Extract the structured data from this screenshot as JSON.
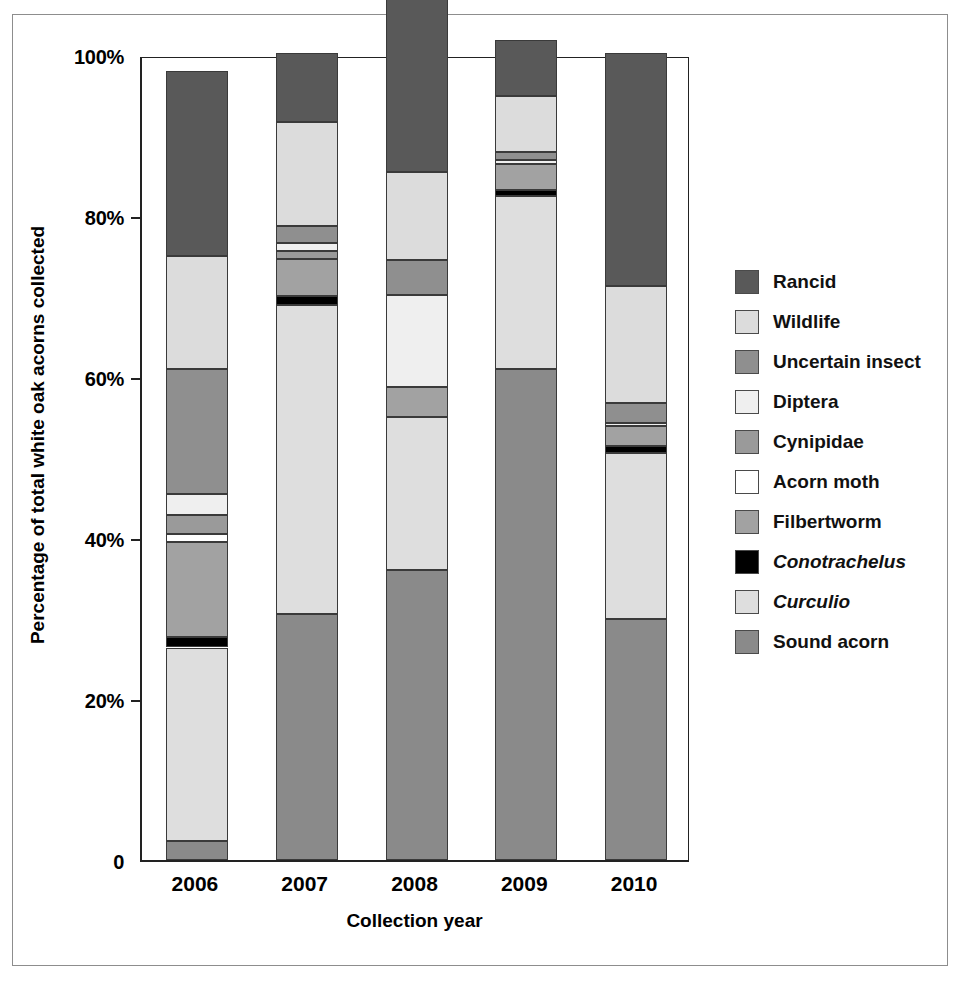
{
  "chart_data": {
    "type": "bar",
    "subtype": "stacked-percentage",
    "title": "",
    "xlabel": "Collection year",
    "ylabel": "Percentage of total white oak acorns collected",
    "categories": [
      "2006",
      "2007",
      "2008",
      "2009",
      "2010"
    ],
    "ylim": [
      0,
      100
    ],
    "ytick_labels": [
      "0",
      "20%",
      "40%",
      "60%",
      "80%",
      "100%"
    ],
    "ytick_values": [
      0,
      20,
      40,
      60,
      80,
      100
    ],
    "grid": false,
    "legend_position": "right",
    "stack_order_bottom_to_top": [
      "Sound acorn",
      "Curculio",
      "Conotrachelus",
      "Filbertworm",
      "Acorn moth",
      "Cynipidae",
      "Diptera",
      "Uncertain insect",
      "Wildlife",
      "Rancid"
    ],
    "series": [
      {
        "name": "Sound acorn",
        "italic": false,
        "color": "#8a8a8a",
        "values": [
          2.4,
          30.5,
          36.0,
          61.0,
          30.0
        ]
      },
      {
        "name": "Curculio",
        "italic": true,
        "color": "#dedede",
        "values": [
          24.0,
          38.5,
          19.0,
          21.5,
          20.5
        ]
      },
      {
        "name": "Conotrachelus",
        "italic": true,
        "color": "#000000",
        "values": [
          1.3,
          1.1,
          0.0,
          0.7,
          0.9
        ]
      },
      {
        "name": "Filbertworm",
        "italic": false,
        "color": "#a2a2a2",
        "values": [
          11.8,
          4.6,
          3.7,
          3.3,
          2.5
        ]
      },
      {
        "name": "Acorn moth",
        "italic": false,
        "color": "#ffffff",
        "values": [
          1.0,
          0.0,
          0.0,
          0.0,
          0.0
        ]
      },
      {
        "name": "Cynipidae",
        "italic": false,
        "color": "#9a9a9a",
        "values": [
          2.3,
          1.0,
          0.0,
          0.0,
          0.0
        ]
      },
      {
        "name": "Diptera",
        "italic": false,
        "color": "#efefef",
        "values": [
          2.7,
          1.0,
          11.5,
          0.4,
          0.4
        ]
      },
      {
        "name": "Uncertain insect",
        "italic": false,
        "color": "#8f8f8f",
        "values": [
          15.5,
          2.0,
          4.3,
          1.0,
          2.5
        ]
      },
      {
        "name": "Wildlife",
        "italic": false,
        "color": "#dcdcdc",
        "values": [
          14.0,
          13.0,
          11.0,
          7.0,
          14.5
        ]
      },
      {
        "name": "Rancid",
        "italic": false,
        "color": "#595959",
        "values": [
          23.0,
          8.5,
          25.0,
          7.0,
          29.0
        ]
      }
    ]
  },
  "legend": {
    "items": [
      {
        "label": "Rancid",
        "color": "#595959",
        "italic": false
      },
      {
        "label": "Wildlife",
        "color": "#dcdcdc",
        "italic": false
      },
      {
        "label": "Uncertain insect",
        "color": "#8f8f8f",
        "italic": false
      },
      {
        "label": "Diptera",
        "color": "#efefef",
        "italic": false
      },
      {
        "label": "Cynipidae",
        "color": "#9a9a9a",
        "italic": false
      },
      {
        "label": "Acorn moth",
        "color": "#ffffff",
        "italic": false
      },
      {
        "label": "Filbertworm",
        "color": "#a2a2a2",
        "italic": false
      },
      {
        "label": "Conotrachelus",
        "color": "#000000",
        "italic": true
      },
      {
        "label": "Curculio",
        "color": "#dedede",
        "italic": true
      },
      {
        "label": "Sound acorn",
        "color": "#8a8a8a",
        "italic": false
      }
    ]
  }
}
